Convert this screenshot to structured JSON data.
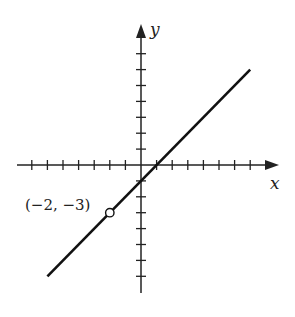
{
  "chart_data": {
    "type": "line",
    "title": "",
    "xlabel": "x",
    "ylabel": "y",
    "xlim": [
      -8,
      8
    ],
    "ylim": [
      -8,
      8
    ],
    "x_ticks": [
      -7,
      -6,
      -5,
      -4,
      -3,
      -2,
      -1,
      1,
      2,
      3,
      4,
      5,
      6,
      7
    ],
    "y_ticks": [
      -7,
      -6,
      -5,
      -4,
      -3,
      -2,
      -1,
      1,
      2,
      3,
      4,
      5,
      6,
      7
    ],
    "tick_labels_shown": false,
    "grid": false,
    "series": [
      {
        "name": "y = x - 1",
        "equation": "y = x - 1",
        "x": [
          -6,
          7
        ],
        "y": [
          -7,
          6
        ],
        "color": "#111111"
      }
    ],
    "annotations": [
      {
        "type": "open-circle",
        "x": -2,
        "y": -3,
        "label": "(−2, −3)"
      }
    ]
  },
  "labels": {
    "x_axis": "x",
    "y_axis": "y",
    "point": "(−2, −3)"
  }
}
